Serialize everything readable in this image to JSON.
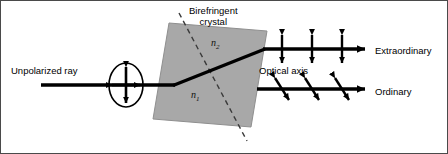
{
  "figure": {
    "kind": "optics-diagram",
    "width": 448,
    "height": 154,
    "background": "#ffffff",
    "border_color": "#4a4a4a"
  },
  "colors": {
    "crystal_fill": "#a8a8a8",
    "crystal_stroke": "#8f8f8f",
    "ray": "#000000",
    "arrow": "#000000",
    "dashed_axis": "#3a3a3a",
    "text": "#000000"
  },
  "labels": {
    "unpolarized_ray": "Unpolarized ray",
    "crystal_line1": "Birefringent",
    "crystal_line2": "crystal",
    "optical_axis": "Optical axis",
    "extraordinary": "Extraordinary",
    "ordinary": "Ordinary",
    "index_upper": "n",
    "index_upper_sub": "2",
    "index_lower": "n",
    "index_lower_sub": "1"
  },
  "geometry": {
    "incident_ray": {
      "x1": 40,
      "y1": 84,
      "x2": 172,
      "y2": 84
    },
    "internal_ray": {
      "x1": 172,
      "y1": 84,
      "x2": 262,
      "y2": 48
    },
    "extraordinary_ray": {
      "x1": 262,
      "y1": 48,
      "x2": 368,
      "y2": 48
    },
    "ordinary_ray": {
      "x1": 258,
      "y1": 88,
      "x2": 368,
      "y2": 88
    },
    "crystal_polygon": "168,22 266,30 250,126 152,118",
    "optical_axis_dashed": {
      "x1": 178,
      "y1": 12,
      "x2": 246,
      "y2": 140
    },
    "unpolarized_symbol": {
      "cx": 125,
      "cy": 84,
      "rx": 17,
      "ry": 22
    }
  },
  "polarization": {
    "extraordinary_markers": {
      "orientation": "vertical",
      "description": "vertical double-headed arrows perpendicular to ray",
      "positions_x": [
        281,
        311,
        341
      ],
      "y": 48,
      "half_length": 15
    },
    "ordinary_markers": {
      "orientation": "diagonal",
      "description": "tilted double-headed arrows across ray",
      "positions_x": [
        281,
        311,
        341
      ],
      "y": 88,
      "half_length": 13,
      "tilt_deg": 28
    },
    "unpolarized_markers": {
      "description": "ellipse with both vertical and horizontal double-headed arrows",
      "orientations": [
        "vertical",
        "horizontal"
      ]
    }
  },
  "icons": {
    "arrowhead": "triangle-arrowhead-icon",
    "double_arrow": "double-headed-arrow-icon",
    "ellipse": "ellipse-outline-icon",
    "dashed_line": "dashed-line-icon"
  }
}
